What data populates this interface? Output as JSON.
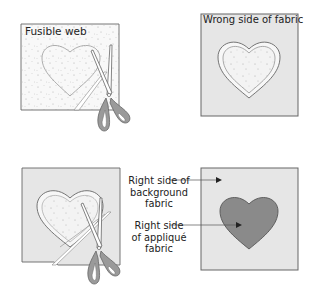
{
  "diagram": {
    "panels": [
      {
        "id": "panel-1",
        "label": "Fusible web",
        "step": 1
      },
      {
        "id": "panel-2",
        "label": "Wrong side of fabric",
        "step": 2
      },
      {
        "id": "panel-3",
        "label": "",
        "step": 3
      },
      {
        "id": "panel-4",
        "label": "",
        "step": 4
      }
    ],
    "callouts": {
      "background": "Right side of background fabric",
      "background_lines": [
        "Right side of",
        "background",
        "fabric"
      ],
      "applique": "Right side of appliqué fabric",
      "applique_lines": [
        "Right side",
        "of appliqué",
        "fabric"
      ]
    },
    "colors": {
      "outline": "#555555",
      "fabric_light": "#e6e6e6",
      "fusible_web": "#f7f7f7",
      "applique_heart": "#8a8a8a",
      "scissors_handle": "#9a9a9a",
      "text": "#222222"
    },
    "icons": [
      "scissors-icon",
      "heart-shape",
      "arrow-icon"
    ]
  }
}
